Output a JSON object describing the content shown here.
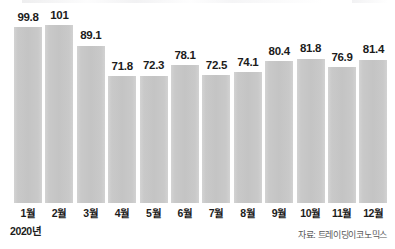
{
  "chart_data": {
    "type": "bar",
    "title": "",
    "subtitle": "",
    "xlabel": "",
    "ylabel": "",
    "grid": false,
    "legend": false,
    "ylim": [
      0,
      101
    ],
    "year_label": "2020년",
    "categories": [
      "1월",
      "2월",
      "3월",
      "4월",
      "5월",
      "6월",
      "7월",
      "8월",
      "9월",
      "10월",
      "11월",
      "12월"
    ],
    "values": [
      99.8,
      101,
      89.1,
      71.8,
      72.3,
      78.1,
      72.5,
      74.1,
      80.4,
      81.8,
      76.9,
      81.4
    ],
    "value_labels": [
      "99.8",
      "101",
      "89.1",
      "71.8",
      "72.3",
      "78.1",
      "72.5",
      "74.1",
      "80.4",
      "81.8",
      "76.9",
      "81.4"
    ],
    "bar_color": "#c8c8c8"
  },
  "footer": {
    "source": "자료: 트레이딩이코노믹스"
  }
}
